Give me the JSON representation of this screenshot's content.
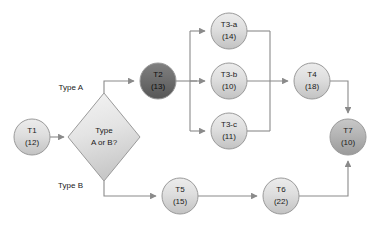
{
  "diagram": {
    "background_color": "#ffffff",
    "connector_color": "#8a8a8a",
    "node_border_color": "#9a9a9a",
    "colors": {
      "node_fill_light_top": "#e8e8e8",
      "node_fill_light_bottom": "#c9c9c9",
      "node_fill_mid_top": "#c4c4c4",
      "node_fill_mid_bottom": "#9e9e9e",
      "node_fill_dark_top": "#7a7a7a",
      "node_fill_dark_bottom": "#5a5a5a",
      "diamond_fill_top": "#efefef",
      "diamond_fill_bottom": "#cfcfcf",
      "text_color": "#1a1a1a"
    },
    "nodes": [
      {
        "id": "T1",
        "name": "T1",
        "duration": "(12)",
        "shape": "circle",
        "shade": "light",
        "cx": 32,
        "cy": 137,
        "r": 18
      },
      {
        "id": "T2",
        "name": "T2",
        "duration": "(13)",
        "shape": "circle",
        "shade": "dark",
        "cx": 158,
        "cy": 81,
        "r": 18
      },
      {
        "id": "T3a",
        "name": "T3-a",
        "duration": "(14)",
        "shape": "circle",
        "shade": "light",
        "cx": 229,
        "cy": 31,
        "r": 18
      },
      {
        "id": "T3b",
        "name": "T3-b",
        "duration": "(10)",
        "shape": "circle",
        "shade": "light",
        "cx": 229,
        "cy": 81,
        "r": 18
      },
      {
        "id": "T3c",
        "name": "T3-c",
        "duration": "(11)",
        "shape": "circle",
        "shade": "light",
        "cx": 229,
        "cy": 131,
        "r": 18
      },
      {
        "id": "T4",
        "name": "T4",
        "duration": "(18)",
        "shape": "circle",
        "shade": "light",
        "cx": 312,
        "cy": 81,
        "r": 18
      },
      {
        "id": "T7",
        "name": "T7",
        "duration": "(10)",
        "shape": "circle",
        "shade": "mid",
        "cx": 348,
        "cy": 137,
        "r": 18
      },
      {
        "id": "T5",
        "name": "T5",
        "duration": "(15)",
        "shape": "circle",
        "shade": "light",
        "cx": 180,
        "cy": 196,
        "r": 18
      },
      {
        "id": "T6",
        "name": "T6",
        "duration": "(22)",
        "shape": "circle",
        "shade": "light",
        "cx": 281,
        "cy": 196,
        "r": 18
      }
    ],
    "decision": {
      "id": "D1",
      "line1": "Type",
      "line2": "A or B?",
      "shape": "diamond",
      "cx": 104,
      "cy": 137,
      "half_width": 36,
      "half_height": 44
    },
    "edge_labels": [
      {
        "id": "type-a",
        "text": "Type A",
        "x": 83,
        "y": 88
      },
      {
        "id": "type-b",
        "text": "Type B",
        "x": 83,
        "y": 186
      }
    ],
    "edges": [
      {
        "from": "T1",
        "to": "D1",
        "label": ""
      },
      {
        "from": "D1",
        "to": "T2",
        "label": "Type A"
      },
      {
        "from": "T2",
        "to": "T3a",
        "label": ""
      },
      {
        "from": "T2",
        "to": "T3b",
        "label": ""
      },
      {
        "from": "T2",
        "to": "T3c",
        "label": ""
      },
      {
        "from": "T3a",
        "to": "T4",
        "label": ""
      },
      {
        "from": "T3b",
        "to": "T4",
        "label": ""
      },
      {
        "from": "T3c",
        "to": "T4",
        "label": ""
      },
      {
        "from": "T4",
        "to": "T7",
        "label": ""
      },
      {
        "from": "D1",
        "to": "T5",
        "label": "Type B"
      },
      {
        "from": "T5",
        "to": "T6",
        "label": ""
      },
      {
        "from": "T6",
        "to": "T7",
        "label": ""
      }
    ]
  }
}
